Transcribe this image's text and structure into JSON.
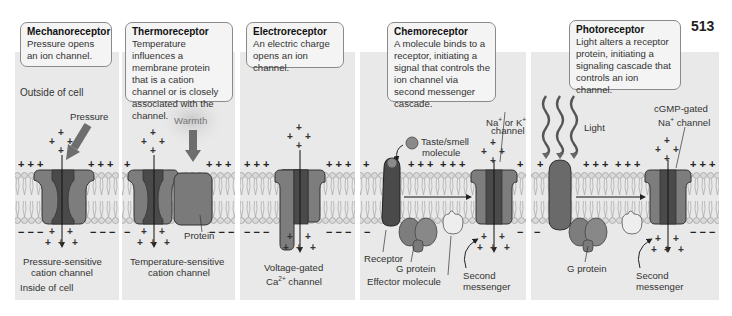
{
  "page_number": "513",
  "colors": {
    "panel_bg": "#e9e9e9",
    "box_bg": "#f4f4f4",
    "channel_dark": "#4a4a4a",
    "channel_mid": "#7a7a7a",
    "arrow_gray": "#6e6e6e",
    "lipid": "#d4d4d4"
  },
  "panels": [
    {
      "title": "Mechanoreceptor",
      "description": "Pressure opens an ion channel.",
      "labels": {
        "outside": "Outside of cell",
        "stimulus": "Pressure",
        "channel_line1": "Pressure-sensitive",
        "channel_line2": "cation channel",
        "inside": "Inside of cell"
      }
    },
    {
      "title": "Thermoreceptor",
      "description": "Temperature influences a membrane protein that is a cation channel or is closely associated with the channel.",
      "labels": {
        "stimulus": "Warmth",
        "protein": "Protein",
        "channel_line1": "Temperature-sensitive",
        "channel_line2": "cation channel"
      }
    },
    {
      "title": "Electroreceptor",
      "description": "An electric charge opens an ion channel.",
      "labels": {
        "channel_line1": "Voltage-gated",
        "channel_ion": "Ca",
        "channel_ion_sup": "2+",
        "channel_line2_rest": " channel"
      }
    },
    {
      "title": "Chemoreceptor",
      "description": "A molecule binds to a receptor, initiating a signal that controls the ion channel via second messenger cascade.",
      "labels": {
        "molecule_line1": "Taste/smell",
        "molecule_line2": "molecule",
        "channel_line1a": "Na",
        "channel_line1_sup1": "+",
        "channel_line1b": " or K",
        "channel_line1_sup2": "+",
        "channel_line2": "channel",
        "receptor": "Receptor",
        "g_protein": "G protein",
        "effector": "Effector molecule",
        "second_line1": "Second",
        "second_line2": "messenger"
      }
    },
    {
      "title": "Photoreceptor",
      "description": "Light alters a receptor protein, initiating a signaling cascade that controls an ion channel.",
      "labels": {
        "stimulus": "Light",
        "channel_line1": "cGMP-gated",
        "channel_line2a": "Na",
        "channel_line2_sup": "+",
        "channel_line2b": " channel",
        "g_protein": "G protein",
        "second_line1": "Second",
        "second_line2": "messenger"
      }
    }
  ],
  "charges": {
    "plus_row": "+ + +",
    "minus_row": "− − −"
  }
}
